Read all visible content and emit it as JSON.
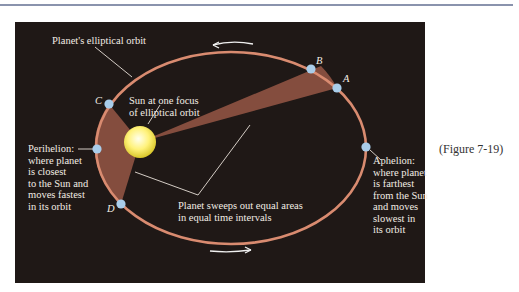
{
  "figure": {
    "caption": "(Figure 7-19)",
    "colors": {
      "rule": "#8a93ad",
      "panel_background": "#1f1816",
      "orbit": "#d98b70",
      "swept_area": "#8a5040",
      "planet": "#a9cdea",
      "sun_core": "#ffffcc",
      "sun_edge": "#e0d030",
      "text": "#f2ece4"
    },
    "labels": {
      "orbit": "Planet's elliptical orbit",
      "sun": "Sun at one focus\nof elliptical orbit",
      "perihelion": "Perihelion:\nwhere planet\nis closest\nto the Sun and\nmoves fastest\nin its orbit",
      "aphelion": "Aphelion:\nwhere planet\nis farthest\nfrom the Sun\nand moves\nslowest in\nits orbit",
      "equal_areas": "Planet sweeps out equal areas\nin equal time intervals"
    },
    "points": {
      "A": "A",
      "B": "B",
      "C": "C",
      "D": "D"
    }
  }
}
